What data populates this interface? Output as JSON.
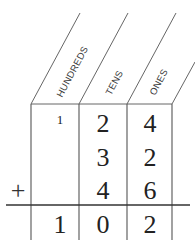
{
  "columns": [
    {
      "label": "HUNDREDS"
    },
    {
      "label": "TENS"
    },
    {
      "label": "ONES"
    }
  ],
  "carry": {
    "hundreds": "1"
  },
  "rows": [
    {
      "hundreds": "",
      "tens": "2",
      "ones": "4"
    },
    {
      "hundreds": "",
      "tens": "3",
      "ones": "2"
    },
    {
      "hundreds": "",
      "tens": "4",
      "ones": "6"
    }
  ],
  "operator": "+",
  "result": {
    "hundreds": "1",
    "tens": "0",
    "ones": "2"
  },
  "colors": {
    "line": "#555555",
    "text": "#222222"
  }
}
